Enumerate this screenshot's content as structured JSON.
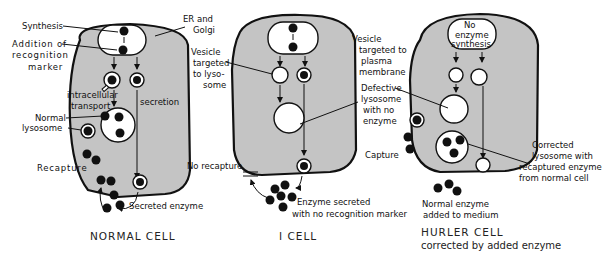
{
  "diagram": {
    "colors": {
      "cytoplasm": "#c4c4c4",
      "outline": "#111111",
      "background": "#ffffff"
    },
    "panels": [
      {
        "id": "normal",
        "title": "NORMAL CELL",
        "subtitle": "",
        "labels": {
          "synthesis": "Synthesis",
          "addition_1": "Addition of",
          "addition_2": "recognition",
          "addition_3": "marker",
          "intracellular_1": "intracellular",
          "intracellular_2": "transport",
          "secretion": "secretion",
          "normal_lysosome_1": "Normal",
          "normal_lysosome_2": "lysosome",
          "recapture": "Recapture",
          "secreted_enzyme": "Secreted enzyme"
        }
      },
      {
        "id": "i-cell",
        "title": "I CELL",
        "subtitle": "",
        "labels": {
          "er_golgi_1": "ER and",
          "er_golgi_2": "Golgi",
          "vesicle_lyso_1": "Vesicle",
          "vesicle_lyso_2": "targeted",
          "vesicle_lyso_3": "to lyso-",
          "vesicle_lyso_4": "some",
          "vesicle_pm_1": "Vesicle",
          "vesicle_pm_2": "targeted to",
          "vesicle_pm_3": "plasma",
          "vesicle_pm_4": "membrane",
          "defective_1": "Defective",
          "defective_2": "lysosome",
          "defective_3": "with no",
          "defective_4": "enzyme",
          "no_recapture": "No recapture",
          "enzyme_secreted_1": "Enzyme secreted",
          "enzyme_secreted_2": "with no recognition marker"
        }
      },
      {
        "id": "hurler",
        "title": "HURLER CELL",
        "subtitle": "corrected by added enzyme",
        "labels": {
          "no_synth_1": "No",
          "no_synth_2": "enzyme",
          "no_synth_3": "synthesis",
          "capture": "Capture",
          "corrected_1": "Corrected",
          "corrected_2": "lysosome with",
          "corrected_3": "recaptured enzyme",
          "corrected_4": "from normal cell",
          "normal_added_1": "Normal enzyme",
          "normal_added_2": "added to medium"
        }
      }
    ]
  }
}
